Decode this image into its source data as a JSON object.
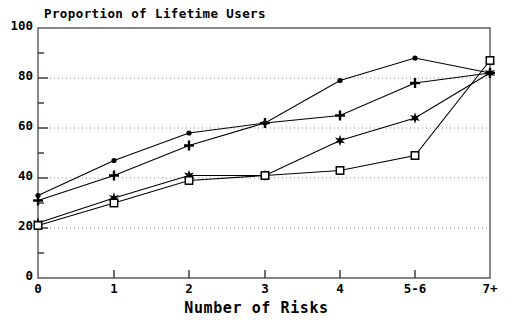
{
  "chart_data": {
    "type": "line",
    "title": "Proportion of Lifetime Users",
    "xlabel": "Number of Risks",
    "ylabel": "",
    "categories": [
      "0",
      "1",
      "2",
      "3",
      "4",
      "5-6",
      "7+"
    ],
    "xtick_labels": [
      "0",
      "1",
      "2",
      "3",
      "4",
      "5-6",
      "7+"
    ],
    "ytick_labels": [
      "0",
      "20",
      "40",
      "60",
      "80",
      "100"
    ],
    "ytick_values": [
      0,
      20,
      40,
      60,
      80,
      100
    ],
    "ylim": [
      0,
      100
    ],
    "grid": "horizontal-dotted",
    "gridlines_at": [
      20,
      40,
      60,
      80
    ],
    "legend": "none",
    "legend_position": "none",
    "series": [
      {
        "name": "series-filled-circle",
        "marker": "filled-circle",
        "values": [
          33,
          47,
          58,
          62,
          79,
          88,
          82
        ]
      },
      {
        "name": "series-plus",
        "marker": "plus",
        "values": [
          31,
          41,
          53,
          62,
          65,
          78,
          82
        ]
      },
      {
        "name": "series-star",
        "marker": "star",
        "values": [
          22,
          32,
          41,
          41,
          55,
          64,
          82
        ]
      },
      {
        "name": "series-open-square",
        "marker": "open-square",
        "values": [
          21,
          30,
          39,
          41,
          43,
          49,
          87
        ]
      }
    ],
    "colors": {
      "line": "#000000",
      "marker": "#000000",
      "axis": "#4d4d4d",
      "grid": "#808080",
      "background": "#ffffff"
    }
  }
}
